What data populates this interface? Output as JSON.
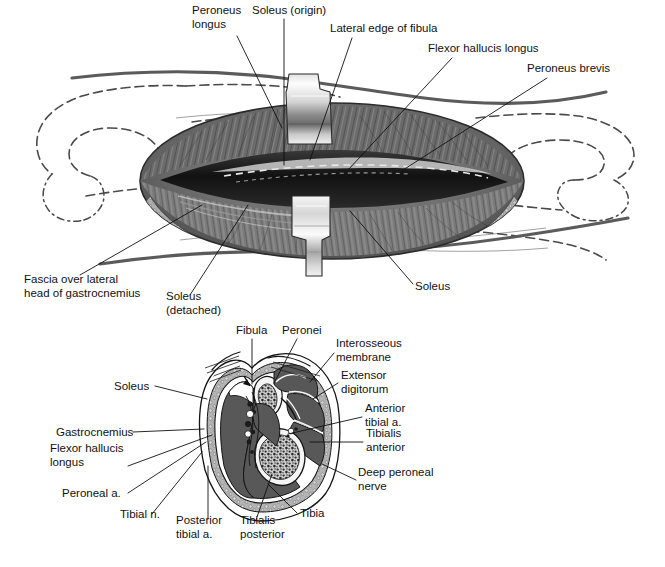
{
  "figure": {
    "panels": [
      {
        "id": "surgical-exposure",
        "name": "Upper surgical exposure illustration"
      },
      {
        "id": "cross-section",
        "name": "Lower leg cross-section"
      }
    ]
  },
  "colors": {
    "muscle_fill": "#585858",
    "fascia_fill": "#9d9d9d",
    "subcutaneous_fill": "#b8b8b8",
    "bone_cortex": "#f2f2f2",
    "marrow": "#6e6e6e",
    "retractor_light": "#fbfbfb",
    "retractor_dark": "#6f6f6f",
    "skin_line": "#5b5b5b",
    "bone_dash": "#4a4a4a",
    "text": "#111111",
    "background": "#ffffff"
  },
  "upper_panel": {
    "name": "surgical-exposure",
    "labels": [
      {
        "id": "peroneus-longus",
        "lines": [
          "Peroneus",
          "longus"
        ],
        "x": 192,
        "y": 14,
        "anchor": "start",
        "leader": [
          [
            237,
            36
          ],
          [
            282,
            128
          ]
        ]
      },
      {
        "id": "soleus-origin",
        "lines": [
          "Soleus (origin)"
        ],
        "x": 252,
        "y": 14,
        "anchor": "start",
        "leader": [
          [
            284,
            19
          ],
          [
            284,
            165
          ]
        ]
      },
      {
        "id": "lateral-edge-fibula",
        "lines": [
          "Lateral edge of fibula"
        ],
        "x": 330,
        "y": 32,
        "anchor": "start",
        "leader": [
          [
            352,
            38
          ],
          [
            310,
            160
          ]
        ]
      },
      {
        "id": "flexor-hallucis-longus",
        "lines": [
          "Flexor hallucis longus"
        ],
        "x": 428,
        "y": 52,
        "anchor": "start",
        "leader": [
          [
            452,
            58
          ],
          [
            348,
            170
          ]
        ]
      },
      {
        "id": "peroneus-brevis",
        "lines": [
          "Peroneus brevis"
        ],
        "x": 527,
        "y": 72,
        "anchor": "start",
        "leader": [
          [
            547,
            78
          ],
          [
            403,
            170
          ]
        ]
      },
      {
        "id": "fascia-over-lateral-head",
        "lines": [
          "Fascia over lateral",
          "head of gastrocnemius"
        ],
        "x": 24,
        "y": 283,
        "anchor": "start",
        "leader": [
          [
            80,
            275
          ],
          [
            202,
            205
          ]
        ]
      },
      {
        "id": "soleus-detached",
        "lines": [
          "Soleus",
          "(detached)"
        ],
        "x": 166,
        "y": 300,
        "anchor": "start",
        "leader": [
          [
            190,
            295
          ],
          [
            248,
            205
          ]
        ]
      },
      {
        "id": "soleus-lower",
        "lines": [
          "Soleus"
        ],
        "x": 415,
        "y": 290,
        "anchor": "start",
        "leader": [
          [
            413,
            284
          ],
          [
            350,
            211
          ]
        ]
      }
    ]
  },
  "lower_panel": {
    "name": "cross-section",
    "labels": [
      {
        "id": "fibula",
        "lines": [
          "Fibula"
        ],
        "x": 236,
        "y": 334,
        "anchor": "start",
        "leader": [
          [
            252,
            339
          ],
          [
            252,
            384
          ]
        ]
      },
      {
        "id": "peronei",
        "lines": [
          "Peronei"
        ],
        "x": 282,
        "y": 334,
        "anchor": "start",
        "leader": [
          [
            297,
            339
          ],
          [
            274,
            383
          ]
        ]
      },
      {
        "id": "interosseous-membrane",
        "lines": [
          "Interosseous",
          "membrane"
        ],
        "x": 336,
        "y": 347,
        "anchor": "start",
        "leader": [
          [
            334,
            353
          ],
          [
            310,
            382
          ]
        ]
      },
      {
        "id": "extensor-digitorum",
        "lines": [
          "Extensor",
          "digitorum"
        ],
        "x": 341,
        "y": 379,
        "anchor": "start",
        "leader": [
          [
            338,
            383
          ],
          [
            313,
            399
          ]
        ]
      },
      {
        "id": "anterior-tibial-a",
        "lines": [
          "Anterior",
          "tibial a."
        ],
        "x": 365,
        "y": 412,
        "anchor": "start",
        "leader": [
          [
            362,
            417
          ],
          [
            288,
            434
          ]
        ]
      },
      {
        "id": "tibialis-anterior",
        "lines": [
          "Tibialis",
          "anterior"
        ],
        "x": 366,
        "y": 437,
        "anchor": "start",
        "leader": [
          [
            363,
            442
          ],
          [
            310,
            442
          ]
        ]
      },
      {
        "id": "deep-peroneal-nerve",
        "lines": [
          "Deep peroneal",
          "nerve"
        ],
        "x": 358,
        "y": 476,
        "anchor": "start",
        "leader": [
          [
            356,
            480
          ],
          [
            322,
            464
          ]
        ]
      },
      {
        "id": "tibia",
        "lines": [
          "Tibia"
        ],
        "x": 300,
        "y": 517,
        "anchor": "start",
        "leader": [
          [
            297,
            513
          ],
          [
            268,
            484
          ]
        ]
      },
      {
        "id": "tibialis-posterior",
        "lines": [
          "Tibialis",
          "posterior"
        ],
        "x": 240,
        "y": 524,
        "anchor": "start",
        "leader": [
          [
            256,
            520
          ],
          [
            272,
            474
          ]
        ]
      },
      {
        "id": "posterior-tibial-a",
        "lines": [
          "Posterior",
          "tibial a."
        ],
        "x": 176,
        "y": 524,
        "anchor": "start",
        "leader": [
          [
            208,
            519
          ],
          [
            208,
            466
          ]
        ]
      },
      {
        "id": "tibial-n",
        "lines": [
          "Tibial n."
        ],
        "x": 120,
        "y": 518,
        "anchor": "start",
        "leader": [
          [
            152,
            514
          ],
          [
            202,
            452
          ]
        ]
      },
      {
        "id": "peroneal-a",
        "lines": [
          "Peroneal a."
        ],
        "x": 62,
        "y": 497,
        "anchor": "start",
        "leader": [
          [
            128,
            493
          ],
          [
            206,
            442
          ]
        ]
      },
      {
        "id": "flexor-hallucis-longus-cs",
        "lines": [
          "Flexor hallucis",
          "longus"
        ],
        "x": 50,
        "y": 452,
        "anchor": "start",
        "leader": [
          [
            128,
            466
          ],
          [
            212,
            435
          ]
        ]
      },
      {
        "id": "gastrocnemius",
        "lines": [
          "Gastrocnemius"
        ],
        "x": 56,
        "y": 436,
        "anchor": "start",
        "leader": [
          [
            133,
            432
          ],
          [
            204,
            429
          ]
        ]
      },
      {
        "id": "soleus-cs",
        "lines": [
          "Soleus"
        ],
        "x": 114,
        "y": 390,
        "anchor": "start",
        "leader": [
          [
            155,
            386
          ],
          [
            207,
            399
          ]
        ]
      }
    ]
  }
}
